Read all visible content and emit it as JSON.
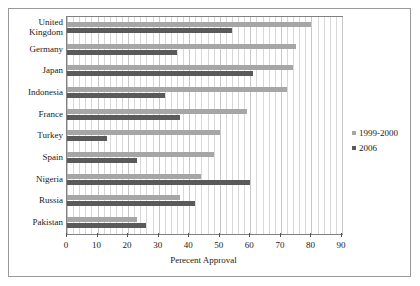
{
  "chart_data": {
    "type": "bar",
    "orientation": "horizontal",
    "title": "",
    "xlabel": "Perecent Approval",
    "ylabel": "",
    "xlim": [
      0,
      90
    ],
    "xticks": [
      0,
      10,
      20,
      30,
      40,
      50,
      60,
      70,
      80,
      90
    ],
    "xtick_labels": [
      "0",
      "10",
      "20",
      "30",
      "40",
      "50",
      "60",
      "70",
      "80",
      "90"
    ],
    "grid": true,
    "grid_axis": "x",
    "legend_position": "right",
    "categories": [
      "United\nKingdom",
      "Germany",
      "Japan",
      "Indonesia",
      "France",
      "Turkey",
      "Spain",
      "Nigeria",
      "Russia",
      "Pakistan"
    ],
    "series": [
      {
        "name": "1999-2000",
        "color": "#a6a6a6",
        "values": [
          80,
          75,
          74,
          72,
          59,
          50,
          48,
          44,
          37,
          23
        ]
      },
      {
        "name": "2006",
        "color": "#5a5a5a",
        "values": [
          54,
          36,
          61,
          32,
          37,
          13,
          23,
          60,
          42,
          26
        ]
      }
    ]
  },
  "legend": {
    "entries": [
      {
        "label": "1999-2000"
      },
      {
        "label": "2006"
      }
    ]
  }
}
